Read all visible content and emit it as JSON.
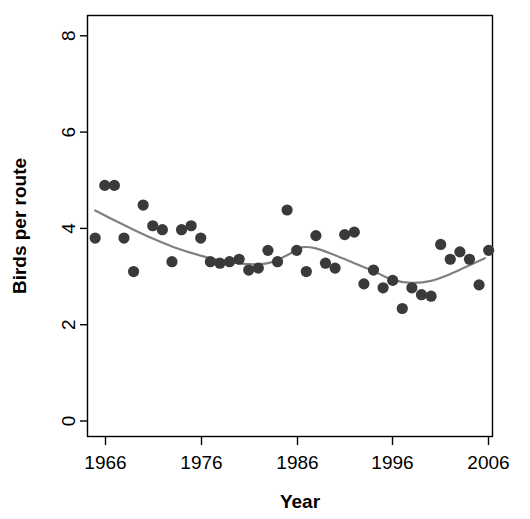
{
  "chart_data": {
    "type": "scatter",
    "title": "",
    "xlabel": "Year",
    "ylabel": "Birds per route",
    "xlim": [
      1965.2,
      2007.4
    ],
    "ylim": [
      0,
      8.55
    ],
    "xticks": [
      1966,
      1976,
      1986,
      1996,
      2006
    ],
    "xtick_labels": [
      "1966",
      "1976",
      "1986",
      "1996",
      "2006"
    ],
    "yticks": [
      0,
      2,
      4,
      6,
      8
    ],
    "ytick_labels": [
      "0",
      "2",
      "4",
      "6",
      "8"
    ],
    "grid": false,
    "legend": false,
    "point_color": "#3a3a3a",
    "line_color": "#808080",
    "series": [
      {
        "name": "Birds per route",
        "type": "scatter",
        "x": [
          1966,
          1967,
          1968,
          1969,
          1970,
          1971,
          1972,
          1973,
          1974,
          1975,
          1976,
          1977,
          1978,
          1979,
          1980,
          1981,
          1982,
          1983,
          1984,
          1985,
          1986,
          1987,
          1988,
          1989,
          1990,
          1991,
          1992,
          1993,
          1994,
          1995,
          1996,
          1997,
          1998,
          1999,
          2000,
          2001,
          2002,
          2003,
          2004,
          2005,
          2006,
          2007
        ],
        "y": [
          4.03,
          5.1,
          5.1,
          4.03,
          3.35,
          4.7,
          4.28,
          4.2,
          3.55,
          4.2,
          4.28,
          4.03,
          3.55,
          3.52,
          3.55,
          3.6,
          3.38,
          3.42,
          3.78,
          3.55,
          4.6,
          3.78,
          3.35,
          4.08,
          3.52,
          3.42,
          4.1,
          4.15,
          3.1,
          3.38,
          3.02,
          3.17,
          2.6,
          3.02,
          2.88,
          2.85,
          3.9,
          3.6,
          3.75,
          3.6,
          3.08,
          3.78
        ]
      },
      {
        "name": "loess-smooth",
        "type": "line",
        "x": [
          1966.0,
          1968.0,
          1970.0,
          1972.0,
          1974.0,
          1976.0,
          1978.0,
          1980.0,
          1982.0,
          1984.0,
          1986.0,
          1987.5,
          1989.0,
          1991.0,
          1993.0,
          1995.0,
          1997.0,
          1999.0,
          2001.0,
          2003.0,
          2005.0,
          2006.6
        ],
        "y": [
          4.59,
          4.39,
          4.2,
          4.02,
          3.86,
          3.73,
          3.62,
          3.55,
          3.5,
          3.52,
          3.68,
          3.84,
          3.82,
          3.68,
          3.52,
          3.36,
          3.18,
          3.12,
          3.16,
          3.3,
          3.48,
          3.62
        ]
      }
    ]
  },
  "axes": {
    "x_axis_title": "Year",
    "y_axis_title": "Birds per route"
  }
}
